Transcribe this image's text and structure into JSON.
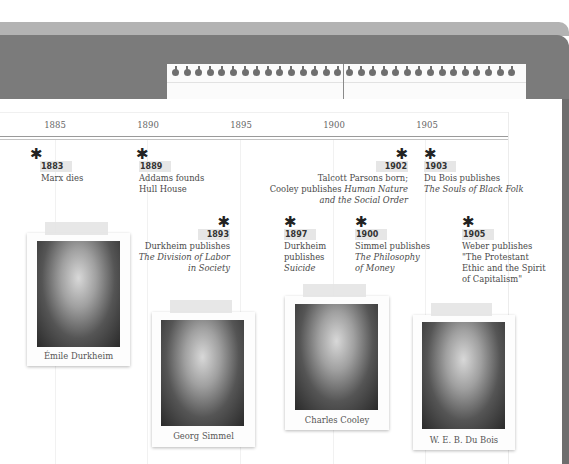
{
  "header": {
    "colors": {
      "top_strip": "#b3b3b3",
      "band": "#7b7b7b",
      "page": "#ffffff"
    },
    "pad": {
      "ring_count": 30
    }
  },
  "axis": {
    "years": [
      "1885",
      "1890",
      "1895",
      "1900",
      "1905"
    ]
  },
  "events": [
    {
      "year": "1883",
      "text_lines": [
        "Marx dies"
      ]
    },
    {
      "year": "1889",
      "text_lines": [
        "Addams founds",
        "Hull House"
      ]
    },
    {
      "year": "1893",
      "text_lines": [
        "Durkheim publishes",
        "The Division of Labor",
        "in Society"
      ]
    },
    {
      "year": "1897",
      "text_lines": [
        "Durkheim",
        "publishes",
        "Suicide"
      ]
    },
    {
      "year": "1900",
      "text_lines": [
        "Simmel publishes",
        "The Philosophy",
        "of Money"
      ]
    },
    {
      "year": "1902",
      "text_lines": [
        "Talcott Parsons born;",
        "Cooley publishes ",
        "Human Nature",
        "and the Social Order"
      ]
    },
    {
      "year": "1903",
      "text_lines": [
        "Du Bois publishes",
        "The Souls of Black Folk"
      ]
    },
    {
      "year": "1905",
      "text_lines": [
        "Weber publishes",
        "\"The Protestant",
        "Ethic and the Spirit",
        "of Capitalism\""
      ]
    }
  ],
  "portraits": [
    {
      "name": "Émile Durkheim"
    },
    {
      "name": "Georg Simmel"
    },
    {
      "name": "Charles Cooley"
    },
    {
      "name": "W. E. B. Du Bois"
    }
  ],
  "icons": {
    "event_marker": "asterisk-icon"
  }
}
